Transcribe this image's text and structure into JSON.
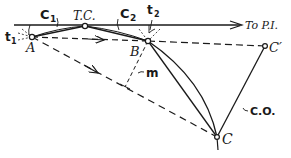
{
  "diagram": {
    "type": "curve-layout geometry",
    "colors": {
      "ink": "#1a1a1a",
      "background": "#ffffff"
    },
    "labels": {
      "c1": "C",
      "c1_sub": "1",
      "c2": "C",
      "c2_sub": "2",
      "tc": "T.C.",
      "t1": "t",
      "t1_sub": "1",
      "t2": "t",
      "t2_sub": "2",
      "to_pi": "To P.I.",
      "a": "A",
      "b": "B",
      "c": "C",
      "c_prime": "C′",
      "m": "m",
      "co": "C.O."
    },
    "points": [
      {
        "name": "A",
        "x": 32,
        "y": 37
      },
      {
        "name": "T.C.",
        "x": 85,
        "y": 26
      },
      {
        "name": "B",
        "x": 148,
        "y": 41
      },
      {
        "name": "C",
        "x": 217,
        "y": 137
      },
      {
        "name": "C'",
        "x": 265,
        "y": 46
      }
    ]
  }
}
